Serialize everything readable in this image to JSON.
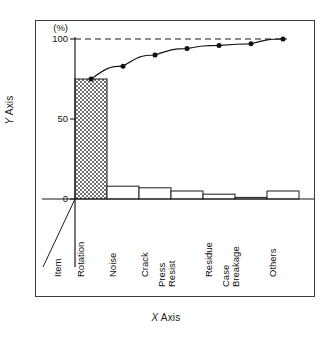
{
  "axis_titles": {
    "y": "Y Axis",
    "y_italic_prefix": "Y",
    "y_rest": " Axis",
    "x_italic_prefix": "X",
    "x_rest": " Axis"
  },
  "y_unit_label": "(%)",
  "y_ticks": [
    "100",
    "50",
    "0"
  ],
  "item_axis_label": "Item",
  "chart_data": {
    "type": "bar",
    "title": "",
    "subtitle": "",
    "xlabel": "X Axis",
    "ylabel": "Y Axis",
    "ylim": [
      0,
      100
    ],
    "yunit": "(%)",
    "ytick_values": [
      0,
      50,
      100
    ],
    "grid": false,
    "legend": "none",
    "categories": [
      "Rotation",
      "Noise",
      "Crack",
      "Press Resist",
      "Residue",
      "Case Breakage",
      "Others"
    ],
    "category_labels": [
      {
        "line1": "Rotation",
        "line2": ""
      },
      {
        "line1": "Noise",
        "line2": ""
      },
      {
        "line1": "Crack",
        "line2": ""
      },
      {
        "line1": "Press",
        "line2": "Resist"
      },
      {
        "line1": "Residue",
        "line2": ""
      },
      {
        "line1": "Case",
        "line2": "Breakage"
      },
      {
        "line1": "Others",
        "line2": ""
      }
    ],
    "series": [
      {
        "name": "Frequency",
        "type": "bar",
        "values": [
          75,
          8,
          7,
          5,
          3,
          1,
          5
        ],
        "hatched_index": 0
      },
      {
        "name": "Cumulative percentage",
        "type": "line",
        "values": [
          75,
          83,
          90,
          94,
          96,
          97,
          100
        ],
        "marker": "filled-circle"
      }
    ],
    "reference_line": {
      "value": 100,
      "style": "dashed"
    }
  }
}
